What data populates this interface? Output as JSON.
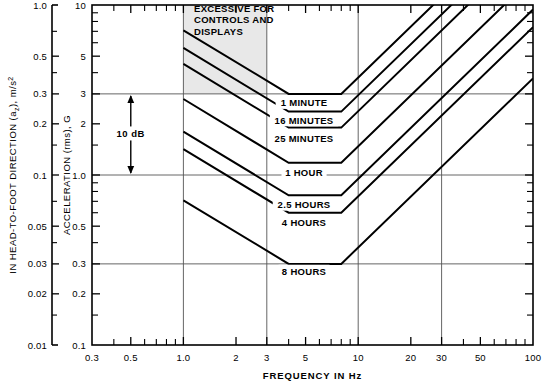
{
  "chart_data": {
    "type": "line",
    "title": "",
    "xlabel": "FREQUENCY IN Hz",
    "ylabel": "ACCELERATION (rms), G",
    "ylabel_secondary": "IN HEAD-TO-FOOT DIRECTION (a",
    "ylabel_secondary_sub": "z",
    "ylabel_secondary_tail": "), m/s",
    "ylabel_secondary_sup": "2",
    "xscale": "log",
    "yscale": "log",
    "xlim": [
      0.3,
      100
    ],
    "ylim": [
      0.1,
      10
    ],
    "ylim_secondary": [
      0.01,
      1.0
    ],
    "grid": "major-only",
    "legend_position": "inline-curve-labels",
    "x_ticks_labeled": [
      {
        "value": 0.3,
        "label": "0.3"
      },
      {
        "value": 0.5,
        "label": "0.5"
      },
      {
        "value": 1.0,
        "label": "1.0"
      },
      {
        "value": 2,
        "label": "2"
      },
      {
        "value": 3,
        "label": "3"
      },
      {
        "value": 5,
        "label": "5"
      },
      {
        "value": 10,
        "label": "10"
      },
      {
        "value": 20,
        "label": "20"
      },
      {
        "value": 30,
        "label": "30"
      },
      {
        "value": 50,
        "label": "50"
      },
      {
        "value": 100,
        "label": "100"
      }
    ],
    "x_ticks_minor": [
      0.4,
      0.6,
      0.7,
      0.8,
      0.9,
      4,
      6,
      7,
      8,
      9,
      40,
      60,
      70,
      80,
      90
    ],
    "y_ticks_labeled": [
      {
        "value": 10,
        "label": "10"
      },
      {
        "value": 5,
        "label": "5"
      },
      {
        "value": 3,
        "label": "3"
      },
      {
        "value": 2,
        "label": "2"
      },
      {
        "value": 1.0,
        "label": "1.0"
      },
      {
        "value": 0.5,
        "label": "0.5"
      },
      {
        "value": 0.3,
        "label": "0.3"
      },
      {
        "value": 0.2,
        "label": "0.2"
      },
      {
        "value": 0.1,
        "label": "0.1"
      }
    ],
    "y_ticks_minor": [
      9,
      8,
      7,
      6,
      4,
      1.5,
      0.9,
      0.8,
      0.7,
      0.6,
      0.4,
      0.15
    ],
    "y_ticks_secondary_labeled": [
      {
        "value": 1.0,
        "label": "1.0"
      },
      {
        "value": 0.5,
        "label": "0.5"
      },
      {
        "value": 0.3,
        "label": "0.3"
      },
      {
        "value": 0.2,
        "label": "0.2"
      },
      {
        "value": 0.1,
        "label": "0.1"
      },
      {
        "value": 0.05,
        "label": "0.05"
      },
      {
        "value": 0.03,
        "label": "0.03"
      },
      {
        "value": 0.02,
        "label": "0.02"
      },
      {
        "value": 0.01,
        "label": "0.01"
      }
    ],
    "y_ticks_secondary_minor": [
      0.7,
      0.4,
      0.15,
      0.07,
      0.04,
      0.015
    ],
    "y_gridlines": [
      3,
      1.0,
      0.3
    ],
    "x_gridlines": [
      1.0,
      3,
      10,
      30
    ],
    "series": [
      {
        "name": "1 MINUTE",
        "label": "1 MINUTE",
        "label_x": 4.9,
        "label_y": 2.62,
        "points": [
          [
            1.0,
            7.1
          ],
          [
            4.0,
            3.0
          ],
          [
            8.0,
            3.0
          ],
          [
            100.0,
            37.0
          ]
        ]
      },
      {
        "name": "16 MINUTES",
        "label": "16 MINUTES",
        "label_x": 4.9,
        "label_y": 2.07,
        "points": [
          [
            1.0,
            5.6
          ],
          [
            4.0,
            2.36
          ],
          [
            8.0,
            2.36
          ],
          [
            100.0,
            29.2
          ]
        ]
      },
      {
        "name": "25 MINUTES",
        "label": "25 MINUTES",
        "label_x": 4.9,
        "label_y": 1.62,
        "points": [
          [
            1.0,
            4.5
          ],
          [
            4.0,
            1.9
          ],
          [
            8.0,
            1.9
          ],
          [
            100.0,
            23.5
          ]
        ]
      },
      {
        "name": "1 HOUR",
        "label": "1 HOUR",
        "label_x": 4.9,
        "label_y": 1.02,
        "points": [
          [
            1.0,
            2.8
          ],
          [
            4.0,
            1.18
          ],
          [
            8.0,
            1.18
          ],
          [
            100.0,
            14.6
          ]
        ]
      },
      {
        "name": "2.5 HOURS",
        "label": "2.5 HOURS",
        "label_x": 4.9,
        "label_y": 0.66,
        "points": [
          [
            1.0,
            1.8
          ],
          [
            4.0,
            0.76
          ],
          [
            8.0,
            0.76
          ],
          [
            100.0,
            9.4
          ]
        ]
      },
      {
        "name": "4 HOURS",
        "label": "4 HOURS",
        "label_x": 4.9,
        "label_y": 0.52,
        "points": [
          [
            1.0,
            1.42
          ],
          [
            4.0,
            0.6
          ],
          [
            8.0,
            0.6
          ],
          [
            100.0,
            7.4
          ]
        ]
      },
      {
        "name": "8 HOURS",
        "label": "8 HOURS",
        "label_x": 4.9,
        "label_y": 0.268,
        "points": [
          [
            1.0,
            0.71
          ],
          [
            4.0,
            0.3
          ],
          [
            8.0,
            0.3
          ],
          [
            100.0,
            3.7
          ]
        ]
      }
    ],
    "annotations": [
      {
        "name": "excessive-zone",
        "lines": [
          "EXCESSIVE FOR",
          "CONTROLS AND",
          "DISPLAYS"
        ],
        "x": 1.15,
        "y": 9.1
      },
      {
        "name": "ten-db-span",
        "label": "10 dB",
        "from_y": 3.0,
        "to_y": 1.0,
        "at_x": 0.5
      }
    ],
    "shaded_region": {
      "name": "excessive-for-controls-and-displays",
      "fill": "#e8e8e8",
      "x_from": 1.0,
      "x_to": 3.0,
      "y_from": 3.0,
      "y_to": 10.0
    },
    "colors": {
      "axis": "#000000",
      "curve": "#000000",
      "grid": "#555555",
      "shade": "#e8e8e8",
      "background": "#ffffff"
    }
  }
}
